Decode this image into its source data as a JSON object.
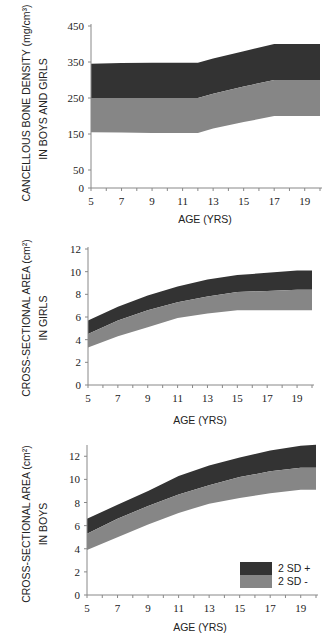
{
  "colors": {
    "upper_band": "#333333",
    "lower_band": "#868686",
    "axis": "#888888"
  },
  "legend": {
    "upper_label": "2 SD +",
    "lower_label": "2 SD  -"
  },
  "chart_data": [
    {
      "type": "area",
      "title": "",
      "ylabel_line1": "CANCELLOUS BONE DENSITY  (mg/cm³)",
      "ylabel_line2": "IN BOYS AND GIRLS",
      "xlabel": "AGE (YRS)",
      "xlim": [
        5,
        20
      ],
      "ylim": [
        0,
        450
      ],
      "xticks": [
        5,
        7,
        9,
        11,
        13,
        15,
        17,
        19
      ],
      "yticks": [
        0,
        50,
        150,
        250,
        350,
        450
      ],
      "x": [
        5,
        7,
        9,
        11,
        12,
        13,
        15,
        17,
        19,
        20
      ],
      "series": [
        {
          "name": "upper (+2 SD)",
          "values": [
            345,
            347,
            348,
            348,
            348,
            360,
            380,
            400,
            400,
            400
          ]
        },
        {
          "name": "mean",
          "values": [
            250,
            250,
            250,
            250,
            250,
            262,
            282,
            300,
            300,
            300
          ]
        },
        {
          "name": "lower (-2 SD)",
          "values": [
            155,
            154,
            153,
            153,
            153,
            165,
            183,
            200,
            200,
            200
          ]
        }
      ],
      "grid": false
    },
    {
      "type": "area",
      "title": "",
      "ylabel_line1": "CROSS-SECTIONAL AREA  (cm²)",
      "ylabel_line2": "IN GIRLS",
      "xlabel": "AGE  (YRS)",
      "xlim": [
        5,
        20
      ],
      "ylim": [
        0,
        12
      ],
      "xticks": [
        5,
        7,
        9,
        11,
        13,
        15,
        17,
        19
      ],
      "yticks": [
        0,
        2,
        4,
        6,
        8,
        10,
        12
      ],
      "x": [
        5,
        7,
        9,
        11,
        13,
        15,
        17,
        19,
        20
      ],
      "series": [
        {
          "name": "upper (+2 SD)",
          "values": [
            5.7,
            6.9,
            7.9,
            8.7,
            9.3,
            9.7,
            9.9,
            10.1,
            10.1
          ]
        },
        {
          "name": "mean",
          "values": [
            4.5,
            5.7,
            6.6,
            7.3,
            7.8,
            8.2,
            8.3,
            8.4,
            8.4
          ]
        },
        {
          "name": "lower (-2 SD)",
          "values": [
            3.3,
            4.3,
            5.1,
            5.9,
            6.3,
            6.6,
            6.6,
            6.6,
            6.6
          ]
        }
      ],
      "grid": false
    },
    {
      "type": "area",
      "title": "",
      "ylabel_line1": "CROSS-SECTIONAL AREA  (cm²)",
      "ylabel_line2": "IN BOYS",
      "xlabel": "AGE  (YRS)",
      "xlim": [
        5,
        20
      ],
      "ylim": [
        0,
        12.8
      ],
      "xticks": [
        5,
        7,
        9,
        11,
        13,
        15,
        17,
        19
      ],
      "yticks": [
        0,
        2,
        4,
        6,
        8,
        10,
        12
      ],
      "x": [
        5,
        7,
        9,
        11,
        13,
        15,
        17,
        19,
        20
      ],
      "series": [
        {
          "name": "upper (+2 SD)",
          "values": [
            6.6,
            7.8,
            9.0,
            10.3,
            11.2,
            11.9,
            12.5,
            12.9,
            13.0
          ]
        },
        {
          "name": "mean",
          "values": [
            5.3,
            6.6,
            7.7,
            8.7,
            9.5,
            10.2,
            10.7,
            11.0,
            11.0
          ]
        },
        {
          "name": "lower (-2 SD)",
          "values": [
            3.9,
            5.0,
            6.1,
            7.1,
            7.9,
            8.4,
            8.8,
            9.1,
            9.1
          ]
        }
      ],
      "legend": [
        "2 SD +",
        "2 SD  -"
      ],
      "legend_position": "lower right",
      "grid": false
    }
  ]
}
